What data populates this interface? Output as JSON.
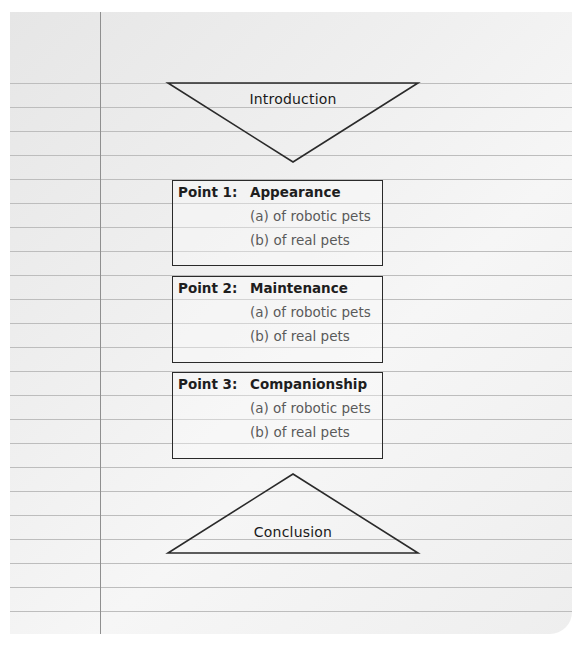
{
  "diagram": {
    "type": "essay-outline-point-by-point",
    "introduction": {
      "label": "Introduction",
      "shape": "inverted-triangle"
    },
    "points": [
      {
        "heading": "Point 1:",
        "topic": "Appearance",
        "subpoints": [
          "(a) of robotic pets",
          "(b) of real pets"
        ]
      },
      {
        "heading": "Point 2:",
        "topic": "Maintenance",
        "subpoints": [
          "(a) of robotic pets",
          "(b) of real pets"
        ]
      },
      {
        "heading": "Point 3:",
        "topic": "Companionship",
        "subpoints": [
          "(a) of robotic pets",
          "(b) of real pets"
        ]
      }
    ],
    "conclusion": {
      "label": "Conclusion",
      "shape": "upright-triangle"
    }
  },
  "colors": {
    "paper": "#efefef",
    "rule_line": "#bdbdbd",
    "margin_line": "#8f8f8f",
    "outline": "#2a2a2a",
    "heading_text": "#1e1e1e",
    "subpoint_text": "#5a5a5a"
  }
}
